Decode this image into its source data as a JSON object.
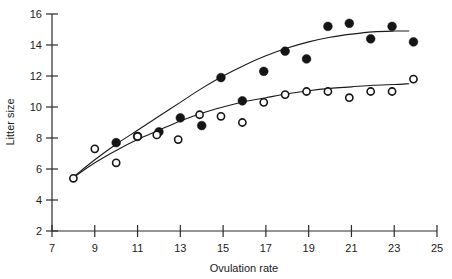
{
  "chart_data": {
    "type": "scatter",
    "title": "",
    "xlabel": "Ovulation rate",
    "ylabel": "Litter size",
    "xlim": [
      7,
      25
    ],
    "ylim": [
      2,
      16
    ],
    "xticks": [
      7,
      9,
      11,
      13,
      15,
      17,
      19,
      21,
      23,
      25
    ],
    "yticks": [
      2,
      4,
      6,
      8,
      10,
      12,
      14,
      16
    ],
    "xtick_labels": [
      "7",
      "9",
      "11",
      "13",
      "15",
      "17",
      "19",
      "21",
      "23",
      "25"
    ],
    "ytick_labels": [
      "2",
      "4",
      "6",
      "8",
      "10",
      "12",
      "14",
      "16"
    ],
    "grid": false,
    "legend": "none",
    "series": [
      {
        "name": "filled-circles",
        "marker": "filled circle",
        "color": "#151515",
        "points": [
          [
            10.0,
            7.7
          ],
          [
            11.0,
            8.1
          ],
          [
            12.0,
            8.4
          ],
          [
            13.0,
            9.3
          ],
          [
            14.0,
            8.8
          ],
          [
            14.9,
            11.9
          ],
          [
            15.9,
            10.4
          ],
          [
            16.9,
            12.3
          ],
          [
            17.9,
            13.6
          ],
          [
            18.9,
            13.1
          ],
          [
            19.9,
            15.2
          ],
          [
            20.9,
            15.4
          ],
          [
            21.9,
            14.4
          ],
          [
            22.9,
            15.2
          ],
          [
            23.9,
            14.2
          ]
        ]
      },
      {
        "name": "open-circles",
        "marker": "open circle",
        "color": "#ffffff",
        "points": [
          [
            8.0,
            5.4
          ],
          [
            9.0,
            7.3
          ],
          [
            10.0,
            6.4
          ],
          [
            11.0,
            8.1
          ],
          [
            11.9,
            8.2
          ],
          [
            12.9,
            7.9
          ],
          [
            13.9,
            9.5
          ],
          [
            14.9,
            9.4
          ],
          [
            15.9,
            9.0
          ],
          [
            16.9,
            10.3
          ],
          [
            17.9,
            10.8
          ],
          [
            18.9,
            11.0
          ],
          [
            19.9,
            11.0
          ],
          [
            20.9,
            10.6
          ],
          [
            21.9,
            11.0
          ],
          [
            22.9,
            11.0
          ],
          [
            23.9,
            11.8
          ]
        ]
      }
    ],
    "fit_curves": [
      {
        "name": "upper-fit-curve",
        "for_series": "filled-circles",
        "points": [
          [
            8.1,
            5.6
          ],
          [
            9.0,
            6.6
          ],
          [
            10.0,
            7.6
          ],
          [
            11.0,
            8.5
          ],
          [
            12.0,
            9.4
          ],
          [
            13.0,
            10.3
          ],
          [
            14.0,
            11.2
          ],
          [
            15.0,
            12.0
          ],
          [
            16.0,
            12.7
          ],
          [
            17.0,
            13.3
          ],
          [
            18.0,
            13.8
          ],
          [
            19.0,
            14.2
          ],
          [
            20.0,
            14.5
          ],
          [
            21.0,
            14.7
          ],
          [
            22.0,
            14.85
          ],
          [
            23.0,
            14.9
          ],
          [
            23.7,
            14.9
          ]
        ]
      },
      {
        "name": "lower-fit-curve",
        "for_series": "open-circles",
        "points": [
          [
            8.05,
            5.5
          ],
          [
            9.0,
            6.4
          ],
          [
            10.0,
            7.2
          ],
          [
            11.0,
            7.9
          ],
          [
            12.0,
            8.5
          ],
          [
            13.0,
            9.1
          ],
          [
            14.0,
            9.6
          ],
          [
            15.0,
            10.0
          ],
          [
            16.0,
            10.35
          ],
          [
            17.0,
            10.6
          ],
          [
            18.0,
            10.85
          ],
          [
            19.0,
            11.05
          ],
          [
            20.0,
            11.2
          ],
          [
            21.0,
            11.3
          ],
          [
            22.0,
            11.4
          ],
          [
            23.0,
            11.45
          ],
          [
            23.7,
            11.5
          ]
        ]
      }
    ]
  }
}
